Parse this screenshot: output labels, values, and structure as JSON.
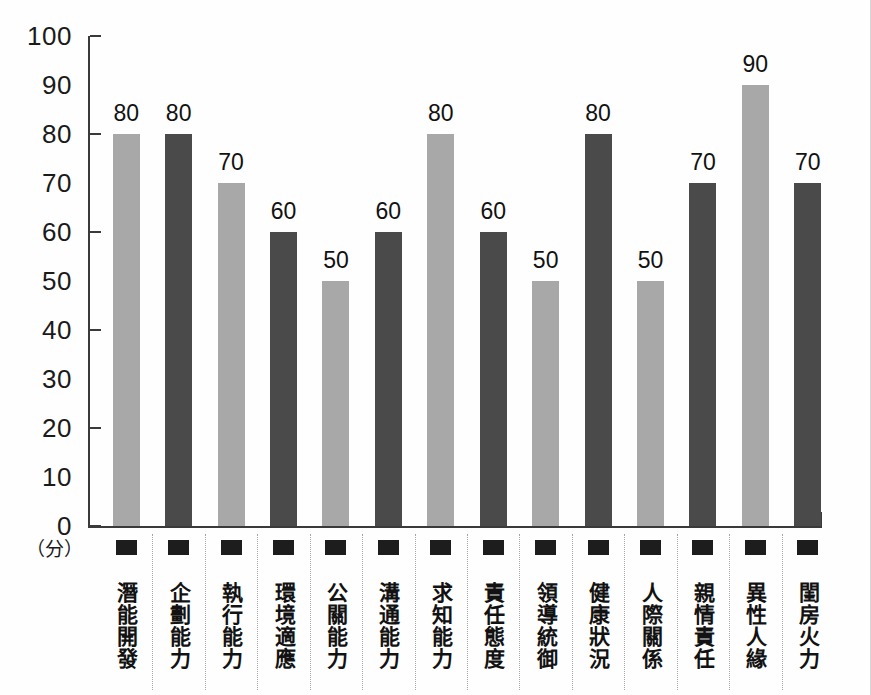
{
  "chart_data": {
    "type": "bar",
    "title": "",
    "subtitle": "",
    "xlabel": "",
    "ylabel": "",
    "unit_label": "（分）",
    "ylim": [
      0,
      100
    ],
    "grid": false,
    "legend": "none",
    "y_ticks": [
      100,
      90,
      80,
      70,
      60,
      50,
      40,
      30,
      20,
      10,
      0
    ],
    "y_ticks_with_marks": [
      100,
      80,
      60,
      40,
      20,
      0
    ],
    "categories": [
      "潛能開發",
      "企劃能力",
      "執行能力",
      "環境適應",
      "公關能力",
      "溝通能力",
      "求知能力",
      "責任態度",
      "領導統御",
      "健康狀況",
      "人際關係",
      "親情責任",
      "異性人緣",
      "閨房火力"
    ],
    "values": [
      80,
      80,
      70,
      60,
      50,
      60,
      80,
      60,
      50,
      80,
      50,
      70,
      90,
      70
    ],
    "bar_styles": [
      "light",
      "dark",
      "light",
      "dark",
      "light",
      "dark",
      "light",
      "dark",
      "light",
      "dark",
      "light",
      "dark",
      "light",
      "dark"
    ],
    "colors": {
      "light_bar": "#a8a8a8",
      "dark_bar": "#4a4a4a",
      "axis": "#3a3a3a",
      "text": "#1a1a1a",
      "marker": "#1d1d1d",
      "separator": "#a5a5a5",
      "background": "#fefefe"
    },
    "marker_icon": "filled-square-marker"
  }
}
